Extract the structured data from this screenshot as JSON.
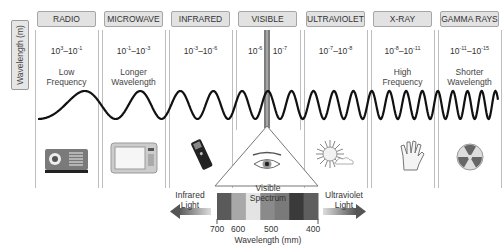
{
  "y_axis_label": "Wavelength (m)",
  "bands": [
    {
      "name": "RADIO",
      "range_base": "10",
      "range_exp_from": "3",
      "range_exp_to": "-1",
      "desc_line1": "Low",
      "desc_line2": "Frequency",
      "icon": "radio-icon"
    },
    {
      "name": "MICROWAVE",
      "range_base": "10",
      "range_exp_from": "-1",
      "range_exp_to": "-3",
      "desc_line1": "Longer",
      "desc_line2": "Wavelength",
      "icon": "microwave-oven-icon"
    },
    {
      "name": "INFRARED",
      "range_base": "10",
      "range_exp_from": "-3",
      "range_exp_to": "-6",
      "desc_line1": "",
      "desc_line2": "",
      "icon": "remote-control-icon"
    },
    {
      "name": "VISIBLE",
      "range_base": "10",
      "range_exp_from": "-6",
      "range_exp_to": "-7",
      "desc_line1": "",
      "desc_line2": "",
      "icon": "eye-icon"
    },
    {
      "name": "ULTRAVIOLET",
      "range_base": "10",
      "range_exp_from": "-7",
      "range_exp_to": "-8",
      "desc_line1": "",
      "desc_line2": "",
      "icon": "sun-icon"
    },
    {
      "name": "X-RAY",
      "range_base": "10",
      "range_exp_from": "-8",
      "range_exp_to": "-11",
      "desc_line1": "High",
      "desc_line2": "Frequency",
      "icon": "xray-hand-icon"
    },
    {
      "name": "GAMMA RAYS",
      "range_base": "10",
      "range_exp_from": "-11",
      "range_exp_to": "-15",
      "desc_line1": "Shorter",
      "desc_line2": "Wavelength",
      "icon": "radiation-icon"
    }
  ],
  "visible_spectrum": {
    "title": "Visible Spectrum",
    "left_label_1": "Infrared",
    "left_label_2": "Light",
    "right_label_1": "Ultraviolet",
    "right_label_2": "Light",
    "ticks": [
      "700",
      "600",
      "500",
      "400"
    ],
    "axis_label": "Wavelength (mm)",
    "bars": [
      "#5a5a5a",
      "#a8a8a8",
      "#e4e4e4",
      "#8a8a8a",
      "#7a7a7a",
      "#3a3a3a",
      "#5e5e5e"
    ]
  }
}
